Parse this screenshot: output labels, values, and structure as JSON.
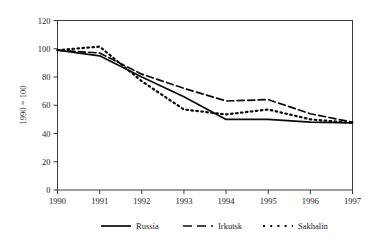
{
  "chart_data": {
    "type": "line",
    "title": "",
    "xlabel": "",
    "ylabel": "1990 = 100",
    "x": [
      1990,
      1991,
      1992,
      1993,
      1994,
      1995,
      1996,
      1997
    ],
    "xticklabels": [
      "1990",
      "1991",
      "1992",
      "1993",
      "1994",
      "1995",
      "1996",
      "1997"
    ],
    "xlim": [
      1990,
      1997
    ],
    "ylim": [
      0,
      120
    ],
    "yticks": [
      0,
      20,
      40,
      60,
      80,
      100,
      120
    ],
    "yticklabels": [
      "0",
      "20",
      "40",
      "60",
      "80",
      "100",
      "120"
    ],
    "grid": false,
    "legend_position": "bottom",
    "series": [
      {
        "name": "Russia",
        "style": "solid",
        "color": "#0a0a0a",
        "values": [
          99,
          95,
          80,
          66,
          50,
          50,
          48,
          47.5
        ]
      },
      {
        "name": "Irkutsk",
        "style": "dashed",
        "color": "#0a0a0a",
        "values": [
          99,
          97,
          82,
          72,
          63,
          64,
          54,
          48
        ]
      },
      {
        "name": "Sakhalin",
        "style": "dotted",
        "color": "#0a0a0a",
        "values": [
          99,
          101.5,
          77,
          57,
          53.5,
          57,
          50,
          47.5
        ]
      }
    ]
  },
  "axis": {
    "y_title": "1990 = 100"
  },
  "legend": {
    "items": [
      {
        "label": "Russia",
        "style": "solid"
      },
      {
        "label": "Irkutsk",
        "style": "dashed"
      },
      {
        "label": "Sakhalin",
        "style": "dotted"
      }
    ]
  }
}
